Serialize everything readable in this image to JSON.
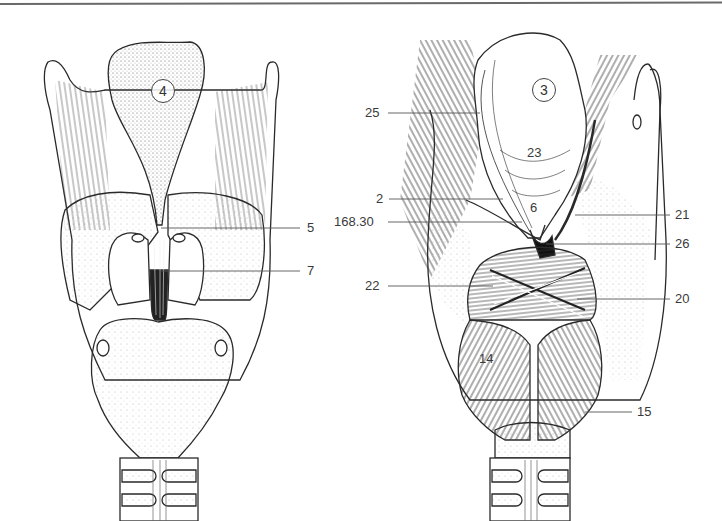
{
  "figure": {
    "left_view": {
      "name": "posterior larynx - mucosa view",
      "circle_label": "4",
      "callouts": [
        {
          "id": "5",
          "text": "5",
          "x": 307,
          "y": 221
        },
        {
          "id": "7",
          "text": "7",
          "x": 307,
          "y": 265
        }
      ]
    },
    "right_view": {
      "name": "posterior larynx - muscles view",
      "circle_label": "3",
      "inner_labels": [
        {
          "id": "23",
          "text": "23",
          "x": 527,
          "y": 146
        },
        {
          "id": "6",
          "text": "6",
          "x": 529,
          "y": 200
        },
        {
          "id": "14",
          "text": "14",
          "x": 479,
          "y": 352
        }
      ],
      "callouts_left": [
        {
          "id": "25",
          "text": "25",
          "x": 365,
          "y": 108
        },
        {
          "id": "2",
          "text": "2",
          "x": 376,
          "y": 194
        },
        {
          "id": "168.30",
          "text": "168.30",
          "x": 334,
          "y": 216
        },
        {
          "id": "22",
          "text": "22",
          "x": 365,
          "y": 280
        }
      ],
      "callouts_right": [
        {
          "id": "21",
          "text": "21",
          "x": 675,
          "y": 210
        },
        {
          "id": "26",
          "text": "26",
          "x": 675,
          "y": 239
        },
        {
          "id": "20",
          "text": "20",
          "x": 675,
          "y": 293
        },
        {
          "id": "15",
          "text": "15",
          "x": 637,
          "y": 405
        }
      ]
    },
    "colors": {
      "line": "#2a2a2a",
      "label_text": "#3a3a3a",
      "leader_line": "#555555",
      "rule": "#6a6a6a"
    }
  }
}
